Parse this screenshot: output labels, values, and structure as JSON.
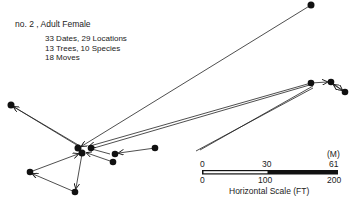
{
  "header": {
    "title": "no. 2 , Adult Female",
    "stats": [
      "33 Dates, 29 Locations",
      "13 Trees, 10 Species",
      "18 Moves"
    ]
  },
  "scale": {
    "unit_top": "(M)",
    "top_ticks": [
      "0",
      "30",
      "61"
    ],
    "bottom_ticks": [
      "0",
      "100",
      "200"
    ],
    "caption": "Horizontal Scale (FT)"
  },
  "colors": {
    "ink": "#111111",
    "background": "#ffffff"
  },
  "nodes": [
    {
      "id": "top-right",
      "x": 311,
      "y": 5
    },
    {
      "id": "far-left",
      "x": 11,
      "y": 105
    },
    {
      "id": "center-a",
      "x": 78,
      "y": 148
    },
    {
      "id": "center-b",
      "x": 82,
      "y": 153
    },
    {
      "id": "center-c",
      "x": 91,
      "y": 148
    },
    {
      "id": "mid-a",
      "x": 115,
      "y": 154
    },
    {
      "id": "mid-b",
      "x": 113,
      "y": 162
    },
    {
      "id": "mid-right",
      "x": 155,
      "y": 148
    },
    {
      "id": "lower-left",
      "x": 30,
      "y": 172
    },
    {
      "id": "bottom",
      "x": 75,
      "y": 192
    },
    {
      "id": "right-a",
      "x": 311,
      "y": 83
    },
    {
      "id": "right-b",
      "x": 331,
      "y": 82
    },
    {
      "id": "right-c",
      "x": 345,
      "y": 92
    }
  ]
}
